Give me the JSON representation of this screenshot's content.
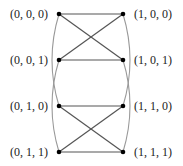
{
  "diagram": {
    "nodes": [
      {
        "id": "n000",
        "label": "(0, 0, 0)",
        "x": 59,
        "y": 14,
        "side": "left"
      },
      {
        "id": "n001",
        "label": "(0, 0, 1)",
        "x": 59,
        "y": 60,
        "side": "left"
      },
      {
        "id": "n010",
        "label": "(0, 1, 0)",
        "x": 59,
        "y": 106,
        "side": "left"
      },
      {
        "id": "n011",
        "label": "(0, 1, 1)",
        "x": 59,
        "y": 152,
        "side": "left"
      },
      {
        "id": "n100",
        "label": "(1, 0, 0)",
        "x": 123,
        "y": 14,
        "side": "right"
      },
      {
        "id": "n101",
        "label": "(1, 0, 1)",
        "x": 123,
        "y": 60,
        "side": "right"
      },
      {
        "id": "n110",
        "label": "(1, 1, 0)",
        "x": 123,
        "y": 106,
        "side": "right"
      },
      {
        "id": "n111",
        "label": "(1, 1, 1)",
        "x": 123,
        "y": 152,
        "side": "right"
      }
    ],
    "edges": [
      {
        "from": "n000",
        "to": "n100",
        "type": "straight"
      },
      {
        "from": "n001",
        "to": "n101",
        "type": "straight"
      },
      {
        "from": "n000",
        "to": "n101",
        "type": "straight"
      },
      {
        "from": "n001",
        "to": "n100",
        "type": "straight"
      },
      {
        "from": "n010",
        "to": "n110",
        "type": "straight"
      },
      {
        "from": "n011",
        "to": "n111",
        "type": "straight"
      },
      {
        "from": "n010",
        "to": "n111",
        "type": "straight"
      },
      {
        "from": "n011",
        "to": "n110",
        "type": "straight"
      },
      {
        "from": "n000",
        "to": "n010",
        "type": "curve-left"
      },
      {
        "from": "n001",
        "to": "n011",
        "type": "curve-left"
      },
      {
        "from": "n100",
        "to": "n110",
        "type": "curve-right"
      },
      {
        "from": "n101",
        "to": "n111",
        "type": "curve-right"
      }
    ],
    "colors": {
      "straight_edge": "#555555",
      "curve_edge": "#999999",
      "node": "#000000",
      "label": "#222222"
    }
  }
}
